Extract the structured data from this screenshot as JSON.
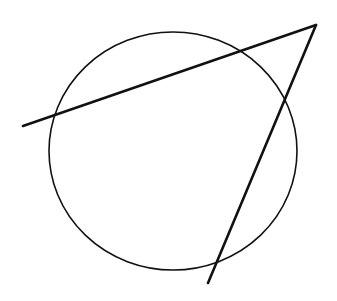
{
  "diagram": {
    "background": "#ffffff",
    "stroke_color": "#111111",
    "circle": {
      "cx": 173,
      "cy": 151,
      "rx": 124,
      "ry": 119,
      "stroke_width": 1.6
    },
    "lines": [
      {
        "id": "secant-1",
        "x1": 23,
        "y1": 126,
        "x2": 316,
        "y2": 25,
        "stroke_width": 2.6
      },
      {
        "id": "secant-2",
        "x1": 316,
        "y1": 25,
        "x2": 208,
        "y2": 283,
        "stroke_width": 2.6
      }
    ],
    "vertex": {
      "x": 316,
      "y": 25
    }
  }
}
